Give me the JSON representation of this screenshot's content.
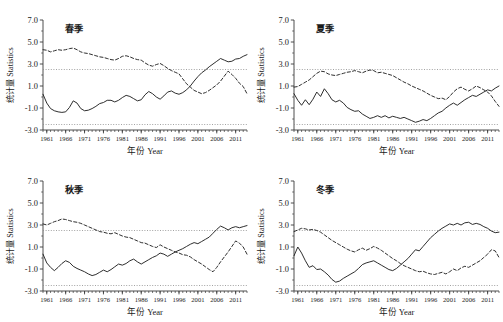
{
  "figure": {
    "axis_title_x": "年份 Year",
    "axis_title_y": "统计量 Statistics",
    "yticks": [
      "7.0",
      "5.0",
      "3.0",
      "1.0",
      "-1.0",
      "-3.0"
    ],
    "ytick_values": [
      7.0,
      5.0,
      3.0,
      1.0,
      -1.0,
      -3.0
    ],
    "xticks": [
      "1961",
      "1966",
      "1971",
      "1976",
      "1981",
      "1986",
      "1991",
      "1996",
      "2001",
      "2006",
      "2011"
    ],
    "xtick_values": [
      1961,
      1966,
      1971,
      1976,
      1981,
      1986,
      1991,
      1996,
      2001,
      2006,
      2011
    ],
    "colors": {
      "axis": "#3b3b3b",
      "series": "#232323",
      "significance": "#8a8a8a",
      "background": "#ffffff"
    }
  },
  "chart_data": [
    {
      "type": "line",
      "title": "春季",
      "panel": "top-left",
      "xlabel": "年份 Year",
      "ylabel": "统计量 Statistics",
      "xlim": [
        1960,
        2014
      ],
      "ylim": [
        -3.0,
        7.0
      ],
      "grid": false,
      "legend": "none",
      "annotations": [
        {
          "name": "significance-upper",
          "value": 2.5,
          "style": "dotted"
        },
        {
          "name": "significance-lower",
          "value": -2.5,
          "style": "dotted"
        }
      ],
      "x": [
        1960,
        1961,
        1962,
        1963,
        1964,
        1965,
        1966,
        1967,
        1968,
        1969,
        1970,
        1971,
        1972,
        1973,
        1974,
        1975,
        1976,
        1977,
        1978,
        1979,
        1980,
        1981,
        1982,
        1983,
        1984,
        1985,
        1986,
        1987,
        1988,
        1989,
        1990,
        1991,
        1992,
        1993,
        1994,
        1995,
        1996,
        1997,
        1998,
        1999,
        2000,
        2001,
        2002,
        2003,
        2004,
        2005,
        2006,
        2007,
        2008,
        2009,
        2010,
        2011,
        2012,
        2013,
        2014
      ],
      "series": [
        {
          "name": "UF",
          "style": "solid",
          "values": [
            0.25,
            -0.55,
            -1.05,
            -1.25,
            -1.35,
            -1.4,
            -1.35,
            -0.95,
            -0.35,
            -0.55,
            -1.05,
            -1.25,
            -1.2,
            -1.05,
            -0.85,
            -0.6,
            -0.5,
            -0.3,
            -0.3,
            -0.45,
            -0.3,
            -0.05,
            0.15,
            0.05,
            -0.15,
            -0.35,
            -0.25,
            0.2,
            0.5,
            0.3,
            0.0,
            -0.2,
            0.1,
            0.45,
            0.55,
            0.35,
            0.25,
            0.4,
            0.65,
            1.0,
            1.45,
            1.85,
            2.2,
            2.45,
            2.75,
            3.0,
            3.25,
            3.5,
            3.35,
            3.2,
            3.25,
            3.45,
            3.5,
            3.7,
            3.85
          ]
        },
        {
          "name": "UB",
          "style": "dashed",
          "values": [
            4.3,
            4.25,
            4.1,
            4.2,
            4.3,
            4.25,
            4.3,
            4.4,
            4.45,
            4.3,
            4.1,
            4.0,
            3.95,
            3.85,
            3.75,
            3.65,
            3.6,
            3.5,
            3.4,
            3.35,
            3.5,
            3.7,
            3.75,
            3.65,
            3.5,
            3.4,
            3.35,
            3.1,
            2.9,
            2.8,
            2.95,
            3.05,
            2.85,
            2.6,
            2.4,
            2.25,
            2.1,
            1.65,
            1.2,
            0.9,
            0.6,
            0.45,
            0.3,
            0.4,
            0.6,
            0.85,
            1.1,
            1.45,
            1.9,
            2.35,
            2.05,
            1.7,
            1.25,
            0.95,
            0.3
          ]
        }
      ]
    },
    {
      "type": "line",
      "title": "夏季",
      "panel": "top-right",
      "xlabel": "年份 Year",
      "ylabel": "统计量 Statistics",
      "xlim": [
        1960,
        2014
      ],
      "ylim": [
        -3.0,
        7.0
      ],
      "grid": false,
      "legend": "none",
      "annotations": [
        {
          "name": "significance-upper",
          "value": 2.5,
          "style": "dotted"
        },
        {
          "name": "significance-lower",
          "value": -2.5,
          "style": "dotted"
        }
      ],
      "x": [
        1960,
        1961,
        1962,
        1963,
        1964,
        1965,
        1966,
        1967,
        1968,
        1969,
        1970,
        1971,
        1972,
        1973,
        1974,
        1975,
        1976,
        1977,
        1978,
        1979,
        1980,
        1981,
        1982,
        1983,
        1984,
        1985,
        1986,
        1987,
        1988,
        1989,
        1990,
        1991,
        1992,
        1993,
        1994,
        1995,
        1996,
        1997,
        1998,
        1999,
        2000,
        2001,
        2002,
        2003,
        2004,
        2005,
        2006,
        2007,
        2008,
        2009,
        2010,
        2011,
        2012,
        2013,
        2014
      ],
      "series": [
        {
          "name": "UF",
          "style": "solid",
          "values": [
            0.3,
            -0.3,
            -0.75,
            -0.25,
            -0.7,
            -0.2,
            0.45,
            0.05,
            0.75,
            0.3,
            -0.25,
            -0.45,
            -0.3,
            -0.55,
            -0.95,
            -1.15,
            -1.3,
            -1.25,
            -1.55,
            -1.75,
            -1.95,
            -1.85,
            -1.7,
            -1.85,
            -1.7,
            -1.9,
            -1.75,
            -1.85,
            -1.95,
            -1.85,
            -2.0,
            -2.15,
            -2.3,
            -2.2,
            -2.05,
            -2.15,
            -1.95,
            -1.7,
            -1.45,
            -1.3,
            -1.0,
            -0.75,
            -0.55,
            -0.75,
            -0.5,
            -0.25,
            -0.05,
            0.15,
            0.05,
            0.25,
            0.45,
            0.65,
            0.55,
            0.8,
            1.0
          ]
        },
        {
          "name": "UB",
          "style": "dashed",
          "values": [
            0.9,
            0.95,
            1.15,
            1.35,
            1.55,
            1.85,
            2.15,
            2.35,
            2.3,
            2.1,
            2.0,
            1.95,
            2.05,
            2.15,
            2.25,
            2.3,
            2.4,
            2.3,
            2.2,
            2.35,
            2.45,
            2.4,
            2.2,
            2.25,
            2.15,
            2.05,
            1.95,
            1.75,
            1.55,
            1.35,
            1.2,
            1.0,
            0.85,
            0.7,
            0.55,
            0.35,
            0.15,
            0.0,
            -0.15,
            -0.1,
            -0.25,
            0.05,
            0.45,
            0.75,
            0.9,
            0.7,
            0.55,
            0.75,
            1.0,
            0.85,
            0.65,
            0.45,
            0.1,
            -0.4,
            -0.85
          ]
        }
      ]
    },
    {
      "type": "line",
      "title": "秋季",
      "panel": "bottom-left",
      "xlabel": "年份 Year",
      "ylabel": "统计量 Statistics",
      "xlim": [
        1960,
        2014
      ],
      "ylim": [
        -3.0,
        7.0
      ],
      "grid": false,
      "legend": "none",
      "annotations": [
        {
          "name": "significance-upper",
          "value": 2.5,
          "style": "dotted"
        },
        {
          "name": "significance-lower",
          "value": -2.5,
          "style": "dotted"
        }
      ],
      "x": [
        1960,
        1961,
        1962,
        1963,
        1964,
        1965,
        1966,
        1967,
        1968,
        1969,
        1970,
        1971,
        1972,
        1973,
        1974,
        1975,
        1976,
        1977,
        1978,
        1979,
        1980,
        1981,
        1982,
        1983,
        1984,
        1985,
        1986,
        1987,
        1988,
        1989,
        1990,
        1991,
        1992,
        1993,
        1994,
        1995,
        1996,
        1997,
        1998,
        1999,
        2000,
        2001,
        2002,
        2003,
        2004,
        2005,
        2006,
        2007,
        2008,
        2009,
        2010,
        2011,
        2012,
        2013,
        2014
      ],
      "series": [
        {
          "name": "UF",
          "style": "solid",
          "values": [
            0.35,
            -0.45,
            -0.85,
            -1.15,
            -0.85,
            -0.5,
            -0.25,
            -0.4,
            -0.75,
            -0.95,
            -1.1,
            -1.25,
            -1.45,
            -1.6,
            -1.5,
            -1.3,
            -1.1,
            -1.25,
            -1.05,
            -0.8,
            -0.55,
            -0.65,
            -0.5,
            -0.25,
            -0.1,
            -0.35,
            -0.55,
            -0.35,
            -0.15,
            0.05,
            0.2,
            0.45,
            0.35,
            0.15,
            0.35,
            0.55,
            0.7,
            0.85,
            1.05,
            1.25,
            1.4,
            1.3,
            1.5,
            1.7,
            1.9,
            2.25,
            2.6,
            2.9,
            2.75,
            2.55,
            2.75,
            2.85,
            2.75,
            2.85,
            2.95
          ]
        },
        {
          "name": "UB",
          "style": "dashed",
          "values": [
            3.1,
            3.0,
            3.15,
            3.3,
            3.4,
            3.55,
            3.5,
            3.4,
            3.3,
            3.25,
            3.15,
            3.0,
            2.85,
            2.7,
            2.55,
            2.4,
            2.35,
            2.25,
            2.2,
            2.3,
            2.15,
            2.0,
            1.9,
            1.85,
            1.7,
            1.55,
            1.4,
            1.35,
            1.2,
            1.05,
            0.95,
            1.2,
            1.0,
            0.85,
            0.7,
            0.55,
            0.45,
            0.3,
            0.25,
            0.1,
            -0.15,
            -0.35,
            -0.55,
            -0.8,
            -1.05,
            -1.25,
            -0.85,
            -0.35,
            0.1,
            0.55,
            1.05,
            1.55,
            1.35,
            1.0,
            0.35
          ]
        }
      ]
    },
    {
      "type": "line",
      "title": "冬季",
      "panel": "bottom-right",
      "xlabel": "年份 Year",
      "ylabel": "统计量 Statistics",
      "xlim": [
        1960,
        2014
      ],
      "ylim": [
        -3.0,
        7.0
      ],
      "grid": false,
      "legend": "none",
      "annotations": [
        {
          "name": "significance-upper",
          "value": 2.5,
          "style": "dotted"
        },
        {
          "name": "significance-lower",
          "value": -2.5,
          "style": "dotted"
        }
      ],
      "x": [
        1960,
        1961,
        1962,
        1963,
        1964,
        1965,
        1966,
        1967,
        1968,
        1969,
        1970,
        1971,
        1972,
        1973,
        1974,
        1975,
        1976,
        1977,
        1978,
        1979,
        1980,
        1981,
        1982,
        1983,
        1984,
        1985,
        1986,
        1987,
        1988,
        1989,
        1990,
        1991,
        1992,
        1993,
        1994,
        1995,
        1996,
        1997,
        1998,
        1999,
        2000,
        2001,
        2002,
        2003,
        2004,
        2005,
        2006,
        2007,
        2008,
        2009,
        2010,
        2011,
        2012,
        2013,
        2014
      ],
      "series": [
        {
          "name": "UF",
          "style": "solid",
          "values": [
            0.2,
            1.0,
            0.45,
            -0.25,
            -0.85,
            -0.7,
            -1.05,
            -1.0,
            -1.25,
            -1.55,
            -1.95,
            -2.2,
            -2.1,
            -1.85,
            -1.65,
            -1.45,
            -1.25,
            -0.95,
            -0.6,
            -0.45,
            -0.35,
            -0.25,
            -0.45,
            -0.65,
            -0.85,
            -1.05,
            -1.15,
            -0.95,
            -0.65,
            -0.35,
            -0.05,
            0.35,
            0.75,
            0.65,
            1.05,
            1.45,
            1.85,
            2.15,
            2.45,
            2.7,
            2.9,
            3.1,
            3.0,
            3.15,
            3.0,
            3.2,
            3.25,
            3.05,
            3.15,
            3.05,
            2.85,
            2.7,
            2.45,
            2.3,
            2.35
          ]
        },
        {
          "name": "UB",
          "style": "dashed",
          "values": [
            2.4,
            2.55,
            2.7,
            2.65,
            2.55,
            2.6,
            2.5,
            2.35,
            2.1,
            1.85,
            1.6,
            1.4,
            1.2,
            1.0,
            0.8,
            0.65,
            0.55,
            0.75,
            0.9,
            0.7,
            0.85,
            1.05,
            0.9,
            0.7,
            0.45,
            0.2,
            -0.05,
            -0.25,
            -0.5,
            -0.7,
            -0.85,
            -1.0,
            -1.15,
            -1.25,
            -1.2,
            -1.35,
            -1.45,
            -1.5,
            -1.4,
            -1.3,
            -1.45,
            -1.25,
            -1.0,
            -1.15,
            -0.9,
            -0.75,
            -0.85,
            -0.65,
            -0.45,
            -0.25,
            0.05,
            0.35,
            0.75,
            0.65,
            0.05
          ]
        }
      ]
    }
  ]
}
